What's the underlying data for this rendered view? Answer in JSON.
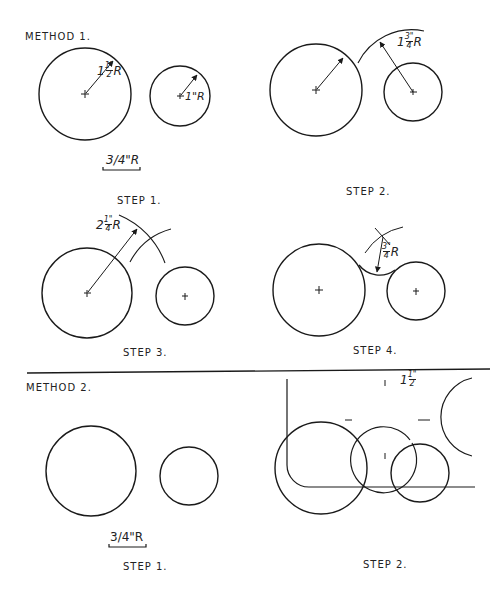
{
  "methods": [
    {
      "label": "METHOD 1.",
      "steps": [
        {
          "label": "STEP 1.",
          "annotations": {
            "large_radius": "1 1/2\" R",
            "small_radius": "1\"R",
            "fillet_radius": "3/4\"R"
          }
        },
        {
          "label": "STEP 2.",
          "annotations": {
            "arc_radius": "1 3/4\" R"
          }
        },
        {
          "label": "STEP 3.",
          "annotations": {
            "arc_radius": "2 1/4\" R"
          }
        },
        {
          "label": "STEP 4.",
          "annotations": {
            "fillet_radius": "3/4\" R"
          }
        }
      ]
    },
    {
      "label": "METHOD 2.",
      "steps": [
        {
          "label": "STEP 1.",
          "annotations": {
            "fillet_radius": "3/4\"R"
          }
        },
        {
          "label": "STEP 2.",
          "annotations": {
            "template_circle": "1 1/2\""
          }
        }
      ]
    }
  ],
  "text": {
    "m1_title": "METHOD 1.",
    "m1_s1": "STEP 1.",
    "m1_s2": "STEP 2.",
    "m1_s3": "STEP 3.",
    "m1_s4": "STEP 4.",
    "m2_title": "METHOD 2.",
    "m2_s1": "STEP 1.",
    "m2_s2": "STEP 2.",
    "r_one_half_whole": "1",
    "r_one_half_num": "1\"",
    "r_one_half_den": "2",
    "r_suffix": "R",
    "r_one": "1\"R",
    "r_three_quarter": "3/4\"R",
    "r_one_3q_whole": "1",
    "r_one_3q_num": "3\"",
    "r_one_3q_den": "4",
    "r_two_q_whole": "2",
    "r_two_q_num": "1\"",
    "r_two_q_den": "4",
    "r_3q_num": "3\"",
    "r_3q_den": "4",
    "m2_three_quarter": "3/4\"R",
    "m2_one_half_whole": "1",
    "m2_one_half_num": "1\"",
    "m2_one_half_den": "2"
  }
}
